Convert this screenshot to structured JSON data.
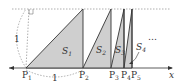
{
  "diagram": {
    "colors": {
      "fill": "#cfcfcf",
      "stroke": "#333333",
      "dotted": "#9a9a9a",
      "background": "#ffffff"
    },
    "axis_label": "x",
    "unit_label_vertical": "1",
    "unit_label_horizontal": "1",
    "ellipsis": "…",
    "points": [
      {
        "name": "P",
        "sub": "1"
      },
      {
        "name": "P",
        "sub": "2"
      },
      {
        "name": "P",
        "sub": "3"
      },
      {
        "name": "P",
        "sub": "4"
      },
      {
        "name": "P",
        "sub": "5"
      }
    ],
    "regions": [
      {
        "name": "S",
        "sub": "1"
      },
      {
        "name": "S",
        "sub": "2"
      },
      {
        "name": "S",
        "sub": "3"
      },
      {
        "name": "S",
        "sub": "4"
      }
    ]
  }
}
